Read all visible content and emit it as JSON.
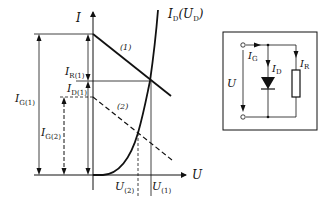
{
  "diagram": {
    "axes": {
      "y_label": "I",
      "x_label": "U"
    },
    "curve_label": {
      "main": "I",
      "sub1": "D",
      "paren_open": "(U",
      "sub2": "D",
      "paren_close": ")"
    },
    "load_lines": [
      {
        "label": "(1)",
        "style": "solid"
      },
      {
        "label": "(2)",
        "style": "dashed"
      }
    ],
    "current_labels": {
      "IG1": {
        "main": "I",
        "sub": "G(1)"
      },
      "IG2": {
        "main": "I",
        "sub": "G(2)"
      },
      "IR1": {
        "main": "I",
        "sub": "R(1)"
      },
      "ID1": {
        "main": "I",
        "sub": "D(1)"
      }
    },
    "voltage_labels": {
      "U2": {
        "main": "U",
        "sub": "(2)"
      },
      "U1": {
        "main": "U",
        "sub": "(1)"
      }
    },
    "circuit": {
      "voltage": "U",
      "IG": {
        "main": "I",
        "sub": "G"
      },
      "ID": {
        "main": "I",
        "sub": "D"
      },
      "IR": {
        "main": "I",
        "sub": "R"
      },
      "components": [
        "diode",
        "resistor"
      ]
    },
    "colors": {
      "ink": "#111111",
      "background": "#ffffff"
    }
  }
}
